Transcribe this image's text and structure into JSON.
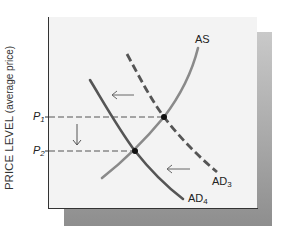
{
  "figure": {
    "y_axis_label_main": "PRICE LEVEL",
    "y_axis_label_sub": "(average price)",
    "colors": {
      "panel_bg": "#f3f3f3",
      "as_curve": "#8a8a8a",
      "ad_curve": "#555555",
      "guide": "#555555",
      "shadow_top": "#c9c9c9",
      "shadow_bottom": "#8e8e8e"
    },
    "curves": {
      "as": {
        "label": "AS",
        "style": "solid"
      },
      "ad3": {
        "label_base": "AD",
        "label_sub": "3",
        "style": "dashed"
      },
      "ad4": {
        "label_base": "AD",
        "label_sub": "4",
        "style": "solid"
      }
    },
    "price_levels": [
      {
        "base": "P",
        "sub": "1"
      },
      {
        "base": "P",
        "sub": "2"
      }
    ],
    "annotations": [
      "Leftward shift arrow (upper, between AD4 and AD3)",
      "Leftward shift arrow (lower, between AD4 and AD3)",
      "Downward arrow from P1 to P2"
    ],
    "equilibria": [
      {
        "name": "E1",
        "curves": [
          "AS",
          "AD3"
        ],
        "price": "P1"
      },
      {
        "name": "E2",
        "curves": [
          "AS",
          "AD4"
        ],
        "price": "P2"
      }
    ]
  }
}
